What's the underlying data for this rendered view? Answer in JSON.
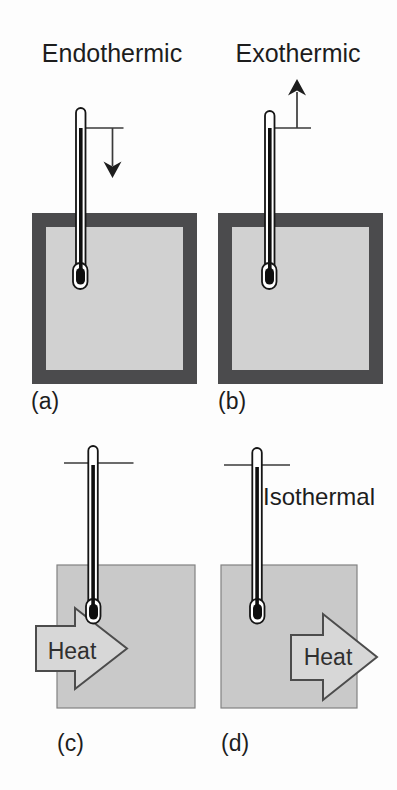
{
  "palette": {
    "background": "#fdfdfd",
    "ink": "#1d1d1d",
    "line": "#3a3a3a",
    "heat_text": "#2f2f2f",
    "container_border": "#4b4b4d",
    "container_fill": "#d1d1d1",
    "block_fill": "#c9c9c9",
    "block_outline": "#828282",
    "arrow_fill": "#d7d7d7",
    "arrow_outline": "#4c4c4c",
    "thermometer_fill": "#ffffff",
    "thermometer_outline": "#151515",
    "mercury": "#0e0e0e"
  },
  "figure": {
    "titles": {
      "endothermic": "Endothermic",
      "exothermic": "Exothermic"
    },
    "panels": {
      "a": {
        "label": "(a)",
        "indicator_icon": "arrow-down-icon"
      },
      "b": {
        "label": "(b)",
        "indicator_icon": "arrow-up-icon"
      },
      "c": {
        "label": "(c)",
        "heat_label": "Heat",
        "heat_arrow_icon": "arrow-right-icon"
      },
      "d": {
        "label": "(d)",
        "heat_label": "Heat",
        "annotation": "Isothermal",
        "heat_arrow_icon": "arrow-right-icon"
      }
    }
  }
}
